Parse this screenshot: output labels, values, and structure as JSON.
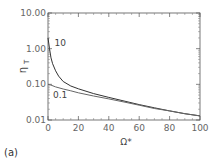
{
  "chart_data": {
    "type": "line",
    "title": "",
    "panel_label": "(a)",
    "xlabel": "Ω*",
    "ylabel": "η_T",
    "ylabel_main": "η",
    "ylabel_sub": "T",
    "xlim": [
      0,
      100
    ],
    "ylim": [
      0.01,
      10.0
    ],
    "yscale": "log",
    "grid": false,
    "x_ticks": [
      "0",
      "20",
      "40",
      "60",
      "80",
      "100"
    ],
    "y_ticks": [
      "10.00",
      "1.00",
      "0.10",
      "0.01"
    ],
    "series": [
      {
        "name": "10",
        "x": [
          0,
          1,
          2,
          3,
          5,
          7,
          10,
          15,
          20,
          30,
          40,
          50,
          60,
          70,
          80,
          90,
          100
        ],
        "values": [
          2.0,
          1.0,
          0.55,
          0.38,
          0.24,
          0.17,
          0.12,
          0.09,
          0.075,
          0.055,
          0.043,
          0.034,
          0.027,
          0.022,
          0.018,
          0.015,
          0.013
        ]
      },
      {
        "name": "0.1",
        "x": [
          0,
          2,
          5,
          10,
          15,
          20,
          30,
          40,
          50,
          60,
          70,
          80,
          90,
          100
        ],
        "values": [
          0.1,
          0.095,
          0.085,
          0.074,
          0.066,
          0.058,
          0.047,
          0.039,
          0.032,
          0.026,
          0.021,
          0.018,
          0.015,
          0.013
        ]
      }
    ],
    "annotations": [
      {
        "text": "10",
        "x": 3,
        "y": 1.4
      },
      {
        "text": "0.1",
        "x": 2,
        "y": 0.05
      }
    ]
  }
}
